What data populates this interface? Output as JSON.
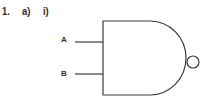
{
  "question": {
    "number": "1.",
    "part": "a)",
    "subpart": "i)"
  },
  "diagram": {
    "type": "logic-gate",
    "gate": "NAND",
    "inputs": [
      {
        "label": "A"
      },
      {
        "label": "B"
      }
    ],
    "stroke_color": "#3a3a3a"
  }
}
